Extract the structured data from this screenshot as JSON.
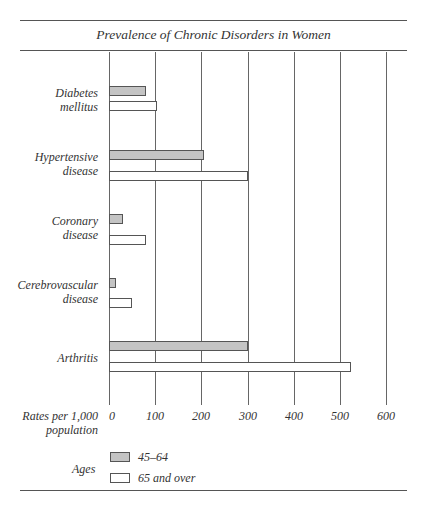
{
  "title": "Prevalence of Chronic Disorders in Women",
  "axis": {
    "label_line1": "Rates per 1,000",
    "label_line2": "population",
    "ticks": [
      "0",
      "100",
      "200",
      "300",
      "400",
      "500",
      "600"
    ]
  },
  "categories": [
    {
      "line1": "Diabetes",
      "line2": "mellitus"
    },
    {
      "line1": "Hypertensive",
      "line2": "disease"
    },
    {
      "line1": "Coronary",
      "line2": "disease"
    },
    {
      "line1": "Cerebrovascular",
      "line2": "disease"
    },
    {
      "line1": "Arthritis",
      "line2": ""
    }
  ],
  "legend": {
    "title": "Ages",
    "items": [
      {
        "label": "45–64",
        "color": "#c4c4c4"
      },
      {
        "label": "65 and over",
        "color": "#ffffff"
      }
    ]
  },
  "chart_data": {
    "type": "bar",
    "orientation": "horizontal",
    "title": "Prevalence of Chronic Disorders in Women",
    "xlabel": "Rates per 1,000 population",
    "ylabel": "",
    "xlim": [
      0,
      600
    ],
    "xticks": [
      0,
      100,
      200,
      300,
      400,
      500,
      600
    ],
    "grid": true,
    "categories": [
      "Diabetes mellitus",
      "Hypertensive disease",
      "Coronary disease",
      "Cerebrovascular disease",
      "Arthritis"
    ],
    "series": [
      {
        "name": "45–64",
        "color": "#c4c4c4",
        "values": [
          80,
          205,
          30,
          15,
          300
        ]
      },
      {
        "name": "65 and over",
        "color": "#ffffff",
        "values": [
          105,
          300,
          80,
          50,
          525
        ]
      }
    ],
    "legend_title": "Ages",
    "legend_position": "bottom-left"
  }
}
